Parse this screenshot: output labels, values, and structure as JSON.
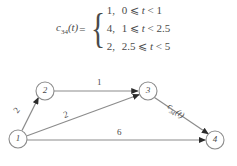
{
  "formula": {
    "function_name": "c",
    "function_sub": "34",
    "function_arg": "(t)",
    "equals": "=",
    "cases": [
      {
        "value": "1,",
        "condition_pre": "0 ⩽ ",
        "condition_var": "t",
        "condition_post": " < 1"
      },
      {
        "value": "4,",
        "condition_pre": "1 ⩽ ",
        "condition_var": "t",
        "condition_post": " < 2.5"
      },
      {
        "value": "2,",
        "condition_pre": "2.5 ⩽ ",
        "condition_var": "t",
        "condition_post": " < 5"
      }
    ]
  },
  "graph": {
    "nodes": [
      {
        "id": "1",
        "label": "1",
        "cx": 18,
        "cy": 139,
        "r": 9
      },
      {
        "id": "2",
        "label": "2",
        "cx": 45,
        "cy": 91,
        "r": 9
      },
      {
        "id": "3",
        "label": "3",
        "cx": 148,
        "cy": 91,
        "r": 9
      },
      {
        "id": "4",
        "label": "4",
        "cx": 215,
        "cy": 140,
        "r": 9
      }
    ],
    "edges": [
      {
        "from": "1",
        "to": "2",
        "label": "2"
      },
      {
        "from": "2",
        "to": "3",
        "label": "1"
      },
      {
        "from": "1",
        "to": "3",
        "label": "2"
      },
      {
        "from": "1",
        "to": "4",
        "label": "6"
      },
      {
        "from": "3",
        "to": "4",
        "label_fn": "c",
        "label_sub": "34",
        "label_arg": "(t)"
      }
    ]
  },
  "colors": {
    "stroke": "#8c8c8c",
    "arrow": "#2b2b2b",
    "text": "#4a4a4a",
    "background": "#ffffff"
  }
}
